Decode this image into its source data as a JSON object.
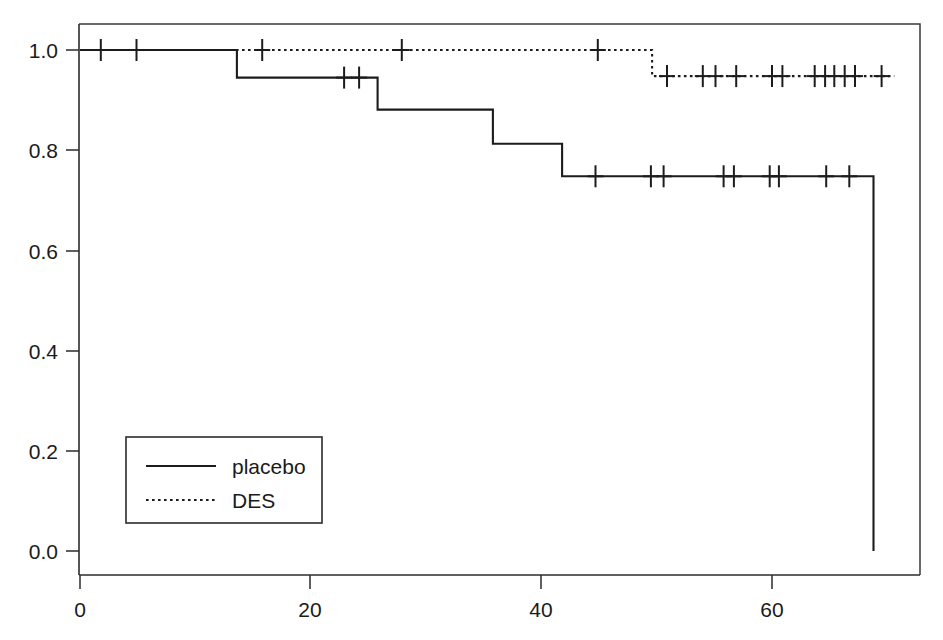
{
  "chart_data": {
    "type": "line",
    "subtype": "kaplan-meier-step",
    "title": "",
    "xlabel": "",
    "ylabel": "",
    "xlim": [
      0,
      72.8
    ],
    "ylim": [
      0.0,
      1.04
    ],
    "xticks": [
      0,
      20,
      40,
      60
    ],
    "xtick_labels": [
      "0",
      "20",
      "40",
      "60"
    ],
    "yticks": [
      0.0,
      0.2,
      0.4,
      0.6,
      0.8,
      1.0
    ],
    "ytick_labels": [
      "0.0",
      "0.2",
      "0.4",
      "0.6",
      "0.8",
      "1.0"
    ],
    "grid": false,
    "legend_position": "lower-left",
    "series": [
      {
        "name": "placebo",
        "linestyle": "solid",
        "color": "#1c1c1c",
        "steps": [
          {
            "x": 0.0,
            "y": 1.0
          },
          {
            "x": 13.6,
            "y": 1.0
          },
          {
            "x": 13.6,
            "y": 0.945
          },
          {
            "x": 25.8,
            "y": 0.945
          },
          {
            "x": 25.8,
            "y": 0.881
          },
          {
            "x": 35.8,
            "y": 0.881
          },
          {
            "x": 35.8,
            "y": 0.813
          },
          {
            "x": 41.8,
            "y": 0.813
          },
          {
            "x": 41.8,
            "y": 0.748
          },
          {
            "x": 68.8,
            "y": 0.748
          },
          {
            "x": 68.8,
            "y": 0.0
          }
        ],
        "censor_times": [
          1.8,
          4.9,
          22.9,
          24.2,
          44.7,
          49.5,
          50.6,
          55.8,
          56.7,
          59.8,
          60.6,
          64.7,
          66.7
        ],
        "censor_values": [
          1.0,
          1.0,
          0.945,
          0.945,
          0.748,
          0.748,
          0.748,
          0.748,
          0.748,
          0.748,
          0.748,
          0.748,
          0.748
        ]
      },
      {
        "name": "DES",
        "linestyle": "dotted",
        "color": "#1c1c1c",
        "steps": [
          {
            "x": 0.0,
            "y": 1.0
          },
          {
            "x": 49.6,
            "y": 1.0
          },
          {
            "x": 49.6,
            "y": 0.948
          },
          {
            "x": 70.6,
            "y": 0.948
          }
        ],
        "censor_times": [
          15.8,
          27.9,
          44.9,
          50.9,
          54.0,
          55.1,
          56.9,
          60.0,
          60.9,
          63.7,
          64.6,
          65.4,
          66.3,
          67.2,
          69.5
        ],
        "censor_values": [
          1.0,
          1.0,
          1.0,
          0.948,
          0.948,
          0.948,
          0.948,
          0.948,
          0.948,
          0.948,
          0.948,
          0.948,
          0.948,
          0.948,
          0.948
        ]
      }
    ]
  },
  "legend": {
    "entries": [
      {
        "label": "placebo",
        "style": "solid"
      },
      {
        "label": "DES",
        "style": "dotted"
      }
    ]
  },
  "axes": {
    "y_tick_labels": [
      "1.0",
      "0.8",
      "0.6",
      "0.4",
      "0.2",
      "0.0"
    ],
    "x_tick_labels": [
      "0",
      "20",
      "40",
      "60"
    ]
  }
}
